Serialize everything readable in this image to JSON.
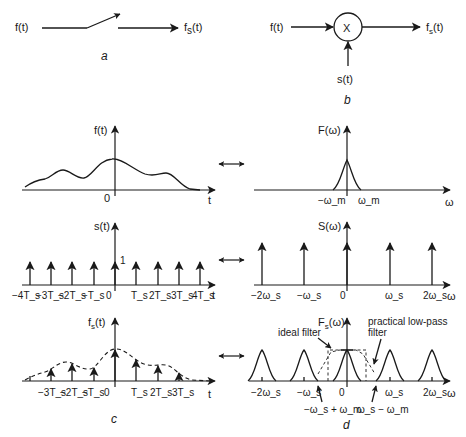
{
  "panel_a": {
    "input_label": "f(t)",
    "output_label": "f_s(t)",
    "output_main": "f",
    "output_sub": "s",
    "output_tail": "(t)",
    "caption": "a",
    "element": "sampling-switch"
  },
  "panel_b": {
    "input_label": "f(t)",
    "multiplier_symbol": "X",
    "output_main": "f",
    "output_sub": "s",
    "output_tail": "(t)",
    "sampling_input": "s(t)",
    "caption": "b"
  },
  "panel_c": {
    "caption": "c",
    "row1": {
      "y_label": "f(t)",
      "x_label": "t",
      "origin": "0"
    },
    "row2": {
      "y_label": "s(t)",
      "x_label": "t",
      "impulse_height_label": "1",
      "ticks": [
        "−4T_s",
        "−3T_s",
        "−2T_s",
        "−T_s",
        "0",
        "T_s",
        "2T_s",
        "3T_s",
        "4T_s"
      ]
    },
    "row3": {
      "y_main": "f",
      "y_sub": "s",
      "y_tail": "(t)",
      "x_label": "t",
      "ticks": [
        "−3T_s",
        "−2T_s",
        "−T_s",
        "0",
        "T_s",
        "2T_s",
        "3T_s"
      ]
    }
  },
  "panel_d": {
    "caption": "d",
    "row1": {
      "y_label": "F(ω)",
      "x_label": "ω",
      "ticks": [
        "−ω_m",
        "ω_m"
      ]
    },
    "row2": {
      "y_label": "S(ω)",
      "x_label": "ω",
      "ticks": [
        "−2ω_s",
        "−ω_s",
        "0",
        "ω_s",
        "2ω_s"
      ]
    },
    "row3": {
      "y_main": "F",
      "y_sub": "s",
      "y_tail": "(ω)",
      "x_label": "ω",
      "ticks": [
        "−2ω_s",
        "−ω_s",
        "0",
        "ω_s",
        "2ω_s"
      ],
      "annotations": {
        "ideal_filter": "ideal filter",
        "practical_filter_line1": "practical low-pass",
        "practical_filter_line2": "filter",
        "left_edge": "−ω_s + ω_m",
        "right_edge": "ω_s − ω_m"
      }
    }
  },
  "transform_pair_symbol": "↔",
  "colors": {
    "ink": "#1a1a1a",
    "background": "#ffffff"
  }
}
